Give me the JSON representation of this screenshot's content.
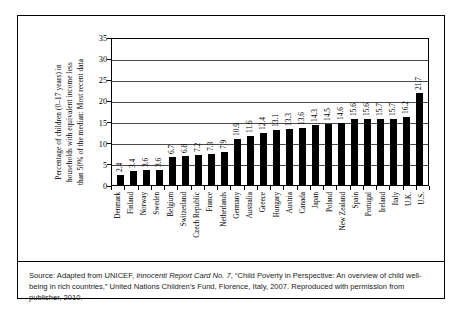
{
  "figure": {
    "ylabel_lines": [
      "Percentage of children (0–17 years) in",
      "households with equivalent income less",
      "than 50% of the median: Most recent data"
    ],
    "caption": {
      "part1": "Source: Adapted from UNICEF, ",
      "italic": "Innocenti Report Card No. 7",
      "part2": ", “Child Poverty in Perspective: An overview of child well-being in rich countries,” United Nations Children’s Fund, Florence, Italy, 2007. Reproduced with permission from publisher, 2010."
    }
  },
  "chart_data": {
    "type": "bar",
    "title": "",
    "xlabel": "",
    "ylabel": "Percentage of children (0–17 years) in households with equivalent income less than 50% of the median: Most recent data",
    "ylim": [
      0,
      35
    ],
    "yticks": [
      0,
      5,
      10,
      15,
      20,
      25,
      30,
      35
    ],
    "ytick_labels": [
      "0",
      "5",
      "10",
      "15",
      "20",
      "25",
      "30",
      "35"
    ],
    "grid": true,
    "legend": "none",
    "bar_color": "#000000",
    "categories": [
      "Denmark",
      "Finland",
      "Norway",
      "Sweden",
      "Belgium",
      "Switzerland",
      "Czech Republic",
      "France",
      "Netherlands",
      "Germany",
      "Australia",
      "Greece",
      "Hungary",
      "Austria",
      "Canada",
      "Japan",
      "Poland",
      "New Zealand",
      "Spain",
      "Portugal",
      "Ireland",
      "Italy",
      "U.K.",
      "U.S."
    ],
    "values": [
      2.4,
      3.4,
      3.6,
      3.6,
      6.7,
      6.8,
      7.2,
      7.3,
      7.9,
      10.9,
      11.6,
      12.4,
      13.1,
      13.3,
      13.6,
      14.3,
      14.5,
      14.6,
      15.6,
      15.6,
      15.7,
      15.7,
      16.2,
      21.7
    ],
    "value_labels": [
      "2.4",
      "3.4",
      "3.6",
      "3.6",
      "6.7",
      "6.8",
      "7.2",
      "7.3",
      "7.9",
      "10.9",
      "11.6",
      "12.4",
      "13.1",
      "13.3",
      "13.6",
      "14.3",
      "14.5",
      "14.6",
      "15.6",
      "15.6",
      "15.7",
      "15.7",
      "16.2",
      "21.7"
    ]
  }
}
